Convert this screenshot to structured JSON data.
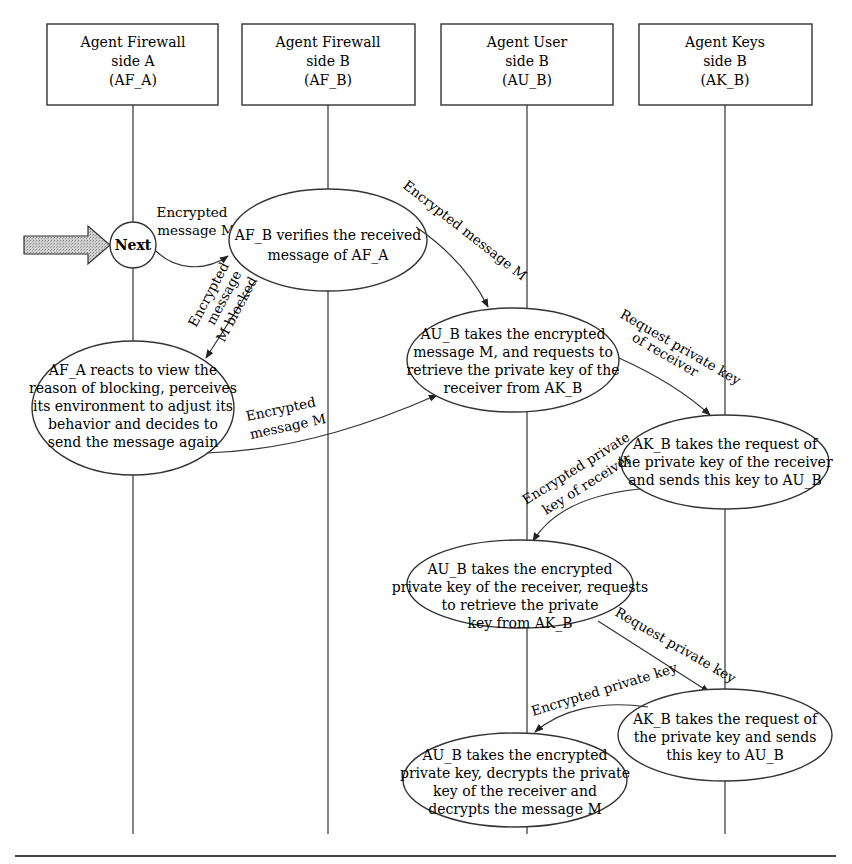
{
  "lanes": [
    {
      "id": "AF_A",
      "lines": [
        "Agent Firewall",
        "side A",
        "(AF_A)"
      ]
    },
    {
      "id": "AF_B",
      "lines": [
        "Agent Firewall",
        "side B",
        "(AF_B)"
      ]
    },
    {
      "id": "AU_B",
      "lines": [
        "Agent User",
        "side B",
        "(AU_B)"
      ]
    },
    {
      "id": "AK_B",
      "lines": [
        "Agent Keys",
        "side B",
        "(AK_B)"
      ]
    }
  ],
  "start": {
    "label": "Next"
  },
  "nodes": {
    "af_b_verify": [
      "AF_B verifies the received",
      "message of AF_A"
    ],
    "af_a_react": [
      "AF_A reacts to view the",
      "reason of blocking, perceives",
      "its environment to adjust its",
      "behavior and decides to",
      "send  the message again"
    ],
    "au_b_request_key": [
      "AU_B takes the encrypted",
      "message M, and requests to",
      "retrieve the private key of the",
      "receiver from AK_B"
    ],
    "ak_b_send_receiver_key": [
      "AK_B takes the request of",
      "the private key of the receiver",
      "and sends this key to AU_B"
    ],
    "au_b_request_private": [
      "AU_B takes the encrypted",
      "private key of the receiver, requests",
      "to retrieve the private",
      "key from AK_B"
    ],
    "ak_b_send_private": [
      "AK_B takes the request of",
      "the private key and sends",
      "this key to AU_B"
    ],
    "au_b_decrypt": [
      "AU_B takes the encrypted",
      "private key, decrypts the private",
      "key of the receiver and",
      "decrypts the message M"
    ]
  },
  "edges": {
    "next_to_verify": [
      "Encrypted",
      "message M"
    ],
    "verify_to_au": [
      "Encrypted message M"
    ],
    "blocked": [
      "Encrypted",
      "message",
      "M blocked"
    ],
    "resend": [
      "Encrypted",
      "message M"
    ],
    "request_receiver_key": [
      "Request private key",
      "of receiver"
    ],
    "encrypted_receiver_key": [
      "Encrypted private",
      "key of receiver"
    ],
    "request_private_key": [
      "Request private key"
    ],
    "encrypted_private_key": [
      "Encrypted private key"
    ]
  }
}
